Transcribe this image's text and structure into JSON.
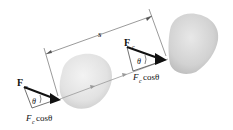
{
  "diagram": {
    "type": "work-done-by-constant-force",
    "displacement_label": "s",
    "left_force": {
      "force_symbol": "F",
      "force_subscript": "c",
      "angle_label": "θ",
      "component_label_F": "F",
      "component_label_sub": "c",
      "component_label_rest": " cosθ"
    },
    "right_force": {
      "force_symbol": "F",
      "force_subscript": "c",
      "angle_label": "θ",
      "component_label_F": "F",
      "component_label_sub": "c",
      "component_label_rest": " cosθ"
    },
    "colors": {
      "body_fill": "#e6e6e6",
      "body_shade": "#cfcfcf",
      "line": "#555555",
      "arrow": "#111111",
      "path": "#999999"
    }
  }
}
